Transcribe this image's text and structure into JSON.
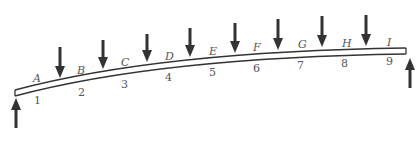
{
  "diagram": {
    "colors": {
      "beam": "#333333",
      "arrow": "#333333",
      "label": "#555555",
      "background": "#ffffff"
    },
    "segment_letters": [
      "A",
      "B",
      "C",
      "D",
      "E",
      "F",
      "G",
      "H",
      "I"
    ],
    "segment_numbers": [
      "1",
      "2",
      "3",
      "4",
      "5",
      "6",
      "7",
      "8",
      "9"
    ],
    "down_load_count": 8,
    "supports": [
      "left-upward-reaction",
      "right-upward-reaction"
    ]
  }
}
